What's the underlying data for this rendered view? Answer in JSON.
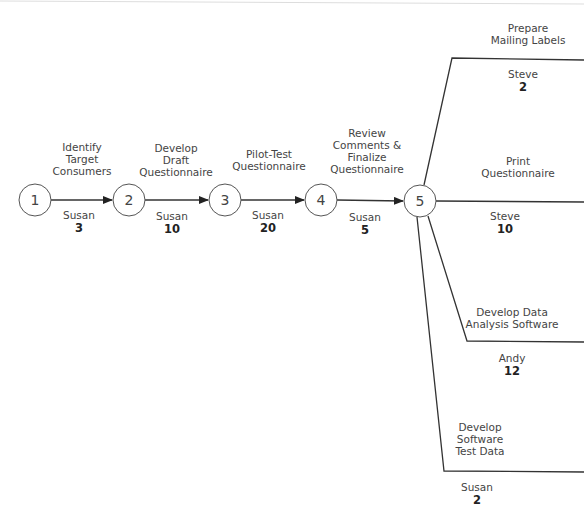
{
  "diagram": {
    "type": "activity-on-arrow network",
    "nodes": [
      {
        "id": "1",
        "label": "1"
      },
      {
        "id": "2",
        "label": "2"
      },
      {
        "id": "3",
        "label": "3"
      },
      {
        "id": "4",
        "label": "4"
      },
      {
        "id": "5",
        "label": "5"
      }
    ],
    "activities": [
      {
        "name": "Identify Target Consumers",
        "lines": [
          "Identify",
          "Target",
          "Consumers"
        ],
        "owner": "Susan",
        "duration": "3",
        "from": "1",
        "to": "2"
      },
      {
        "name": "Develop Draft Questionnaire",
        "lines": [
          "Develop",
          "Draft",
          "Questionnaire"
        ],
        "owner": "Susan",
        "duration": "10",
        "from": "2",
        "to": "3"
      },
      {
        "name": "Pilot-Test Questionnaire",
        "lines": [
          "Pilot-Test",
          "Questionnaire"
        ],
        "owner": "Susan",
        "duration": "20",
        "from": "3",
        "to": "4"
      },
      {
        "name": "Review Comments & Finalize Questionnaire",
        "lines": [
          "Review",
          "Comments &",
          "Finalize",
          "Questionnaire"
        ],
        "owner": "Susan",
        "duration": "5",
        "from": "4",
        "to": "5"
      },
      {
        "name": "Prepare Mailing Labels",
        "lines": [
          "Prepare",
          "Mailing Labels"
        ],
        "owner": "Steve",
        "duration": "2",
        "from": "5"
      },
      {
        "name": "Print Questionnaire",
        "lines": [
          "Print",
          "Questionnaire"
        ],
        "owner": "Steve",
        "duration": "10",
        "from": "5"
      },
      {
        "name": "Develop Data Analysis Software",
        "lines": [
          "Develop Data",
          "Analysis Software"
        ],
        "owner": "Andy",
        "duration": "12",
        "from": "5"
      },
      {
        "name": "Develop Software Test Data",
        "lines": [
          "Develop",
          "Software",
          "Test Data"
        ],
        "owner": "Susan",
        "duration": "2",
        "from": "5"
      }
    ]
  },
  "colors": {
    "line": "#333333",
    "node_stroke": "#555555",
    "text": "#444444"
  }
}
